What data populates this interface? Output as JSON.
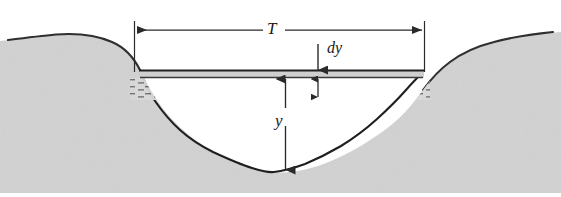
{
  "figure": {
    "labels": {
      "top_width": "T",
      "differential_depth": "dy",
      "depth": "y"
    },
    "colors": {
      "paper": "#ffffff",
      "ink": "#1a1a1a",
      "ground_fill": "#d2d2d2",
      "ground_shadow": "#c4c4c4",
      "water_surface_band": "#cfcfcf",
      "hatch": "#6b6b6b",
      "dimension_line": "#2a2a2a"
    },
    "geometry": {
      "water_surface_y": 70,
      "water_band_bottom_y": 78,
      "channel_bed_low_y": 172,
      "left_dimension_x": 134,
      "right_dimension_x": 424,
      "dimension_line_y": 30
    },
    "elements": [
      "left-bank-terrain",
      "right-bank-terrain",
      "channel-bed-curve",
      "water-surface-line",
      "water-hatch-band",
      "top-width-dimension",
      "depth-dimension",
      "dy-arrow",
      "dy-element-dimension"
    ]
  }
}
